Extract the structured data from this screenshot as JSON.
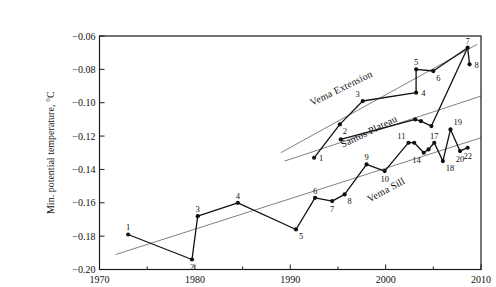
{
  "figure": {
    "width": 460,
    "height": 282,
    "background": "#ffffff",
    "axis_color": "#1a1a1a",
    "line_color": "#111111",
    "trend_color": "#4a4a4a"
  },
  "chart_data": {
    "type": "line",
    "title": "",
    "xlabel": "",
    "ylabel": "Min. potential temperature, °C",
    "xlim": [
      1970,
      2010
    ],
    "ylim": [
      -0.2,
      -0.06
    ],
    "grid": false,
    "x_major_ticks": [
      1970,
      1980,
      1990,
      2000,
      2010
    ],
    "x_minor_ticks": [
      1975,
      1985,
      1995,
      2005
    ],
    "y_ticks": [
      -0.06,
      -0.08,
      -0.1,
      -0.12,
      -0.14,
      -0.16,
      -0.18,
      -0.2
    ],
    "y_tick_labels": [
      "−0.06",
      "−0.08",
      "−0.10",
      "−0.12",
      "−0.14",
      "−0.16",
      "−0.18",
      "−0.20"
    ],
    "x_tick_labels": [
      "1970",
      "1980",
      "1990",
      "2000",
      "2010"
    ],
    "series": [
      {
        "name": "Vema Extension",
        "label": {
          "text": "Vema Extension",
          "x": 1995.5,
          "y": -0.093,
          "angle": -26
        },
        "trend": {
          "x1": 1989.0,
          "y1": -0.13,
          "x2": 2009.6,
          "y2": -0.065
        },
        "points": [
          {
            "n": "1",
            "x": 1992.5,
            "y": -0.133,
            "lp": "right"
          },
          {
            "n": "2",
            "x": 1995.2,
            "y": -0.113,
            "lp": "below-right"
          },
          {
            "n": "3",
            "x": 1997.6,
            "y": -0.099,
            "lp": "above-left"
          },
          {
            "n": "4",
            "x": 2003.2,
            "y": -0.094,
            "lp": "right"
          },
          {
            "n": "5",
            "x": 2003.2,
            "y": -0.08,
            "lp": "above"
          },
          {
            "n": "6",
            "x": 2005.0,
            "y": -0.081,
            "lp": "below-right"
          },
          {
            "n": "7",
            "x": 2008.6,
            "y": -0.067,
            "lp": "above"
          },
          {
            "n": "8",
            "x": 2008.8,
            "y": -0.077,
            "lp": "right"
          }
        ]
      },
      {
        "name": "Santos Plateau",
        "label": {
          "text": "Santos Plateau",
          "x": 1998.4,
          "y": -0.119,
          "angle": -26
        },
        "trend": {
          "x1": 1989.4,
          "y1": -0.135,
          "x2": 2010.0,
          "y2": -0.096
        },
        "points": [
          {
            "n": "",
            "x": 1995.3,
            "y": -0.122,
            "lp": "below"
          },
          {
            "n": "",
            "x": 2003.1,
            "y": -0.11,
            "lp": "above"
          },
          {
            "n": "",
            "x": 2003.7,
            "y": -0.111,
            "lp": "below"
          },
          {
            "n": "",
            "x": 2004.8,
            "y": -0.114,
            "lp": "below"
          },
          {
            "n": "",
            "x": 2008.6,
            "y": -0.067,
            "lp": "above",
            "marker": false
          }
        ]
      },
      {
        "name": "Vema Sill",
        "label": {
          "text": "Vema Sill",
          "x": 2000.2,
          "y": -0.154,
          "angle": -28
        },
        "trend": {
          "x1": 1971.7,
          "y1": -0.191,
          "x2": 2010.0,
          "y2": -0.121
        },
        "points": [
          {
            "n": "1",
            "x": 1973.0,
            "y": -0.179,
            "lp": "above"
          },
          {
            "n": "2",
            "x": 1979.7,
            "y": -0.194,
            "lp": "below"
          },
          {
            "n": "3",
            "x": 1980.3,
            "y": -0.168,
            "lp": "above"
          },
          {
            "n": "4",
            "x": 1984.5,
            "y": -0.16,
            "lp": "above"
          },
          {
            "n": "5",
            "x": 1990.6,
            "y": -0.176,
            "lp": "below-right"
          },
          {
            "n": "6",
            "x": 1992.6,
            "y": -0.157,
            "lp": "above"
          },
          {
            "n": "7",
            "x": 1994.4,
            "y": -0.159,
            "lp": "below"
          },
          {
            "n": "8",
            "x": 1995.7,
            "y": -0.155,
            "lp": "below-right"
          },
          {
            "n": "9",
            "x": 1998.0,
            "y": -0.137,
            "lp": "above"
          },
          {
            "n": "10",
            "x": 1999.9,
            "y": -0.141,
            "lp": "below"
          },
          {
            "n": "11",
            "x": 2002.4,
            "y": -0.124,
            "lp": "above-left"
          },
          {
            "n": "",
            "x": 2003.0,
            "y": -0.124,
            "lp": "above"
          },
          {
            "n": "14",
            "x": 2004.0,
            "y": -0.13,
            "lp": "below-left"
          },
          {
            "n": "",
            "x": 2004.5,
            "y": -0.128,
            "lp": "above"
          },
          {
            "n": "17",
            "x": 2005.1,
            "y": -0.124,
            "lp": "above"
          },
          {
            "n": "18",
            "x": 2006.0,
            "y": -0.135,
            "lp": "below-right"
          },
          {
            "n": "19",
            "x": 2006.8,
            "y": -0.116,
            "lp": "above-right"
          },
          {
            "n": "20",
            "x": 2007.8,
            "y": -0.129,
            "lp": "below"
          },
          {
            "n": "22",
            "x": 2008.6,
            "y": -0.127,
            "lp": "below"
          }
        ]
      }
    ]
  }
}
